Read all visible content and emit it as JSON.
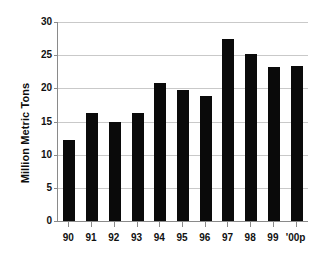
{
  "chart_data": {
    "type": "bar",
    "title": "",
    "xlabel": "",
    "ylabel": "Million Metric Tons",
    "categories": [
      "90",
      "91",
      "92",
      "93",
      "94",
      "95",
      "96",
      "97",
      "98",
      "99",
      "'00p"
    ],
    "values": [
      12.2,
      16.3,
      14.9,
      16.3,
      20.8,
      19.8,
      18.9,
      27.4,
      25.2,
      23.2,
      23.4
    ],
    "ylim": [
      0,
      30
    ],
    "yticks": [
      0,
      5,
      10,
      15,
      20,
      25,
      30
    ],
    "ytick_labels": [
      "0",
      "5",
      "10",
      "15",
      "20",
      "25",
      "30"
    ],
    "grid": true,
    "legend": "none",
    "series_color": "#0a0a0a",
    "gridline_color": "#c9c9c9",
    "axis_color": "#8a8a8a",
    "background": "#ffffff"
  }
}
